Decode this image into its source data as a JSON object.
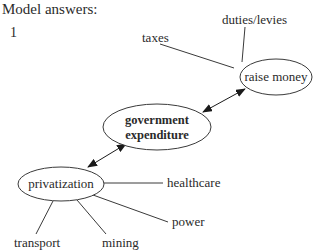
{
  "header": {
    "title": "Model answers:",
    "item_number": "1"
  },
  "diagram": {
    "nodes": {
      "raise_money": {
        "label": "raise money"
      },
      "government_expenditure": {
        "line1": "government",
        "line2": "expenditure"
      },
      "privatization": {
        "label": "privatization"
      }
    },
    "leaves": {
      "taxes": "taxes",
      "duties_levies": "duties/levies",
      "healthcare": "healthcare",
      "power": "power",
      "transport": "transport",
      "mining": "mining"
    },
    "edges": [
      {
        "from": "government expenditure",
        "to": "raise money",
        "type": "bidirectional-arrow"
      },
      {
        "from": "privatization",
        "to": "government expenditure",
        "type": "bidirectional-arrow"
      },
      {
        "from": "raise money",
        "to": "taxes",
        "type": "line"
      },
      {
        "from": "raise money",
        "to": "duties/levies",
        "type": "line"
      },
      {
        "from": "privatization",
        "to": "healthcare",
        "type": "line"
      },
      {
        "from": "privatization",
        "to": "power",
        "type": "line"
      },
      {
        "from": "privatization",
        "to": "transport",
        "type": "line"
      },
      {
        "from": "privatization",
        "to": "mining",
        "type": "line"
      }
    ]
  }
}
